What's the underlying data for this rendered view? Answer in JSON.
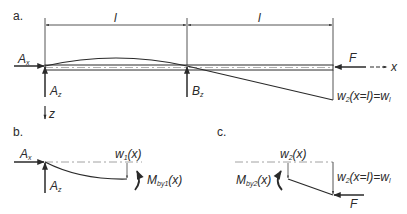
{
  "figure": {
    "panels": [
      {
        "id": "a",
        "label": "a.",
        "span_labels": [
          "l",
          "l"
        ],
        "support_left": {
          "horizontal": "A",
          "horizontal_sub": "x",
          "vertical": "A",
          "vertical_sub": "z"
        },
        "support_middle": {
          "vertical": "B",
          "vertical_sub": "z"
        },
        "force": "F",
        "axis_x": "x",
        "axis_z": "z",
        "tip_deflection": {
          "main": "w",
          "sub": "2",
          "rest": "(x=l)=w",
          "rest_sub": "l"
        }
      },
      {
        "id": "b",
        "label": "b.",
        "support_left": {
          "horizontal": "A",
          "horizontal_sub": "x",
          "vertical": "A",
          "vertical_sub": "z"
        },
        "deflection": {
          "main": "w",
          "sub": "1",
          "rest": "(x)"
        },
        "moment": {
          "main": "M",
          "sub": "by1",
          "rest": "(x)"
        }
      },
      {
        "id": "c",
        "label": "c.",
        "deflection": {
          "main": "w",
          "sub": "2",
          "rest": "(x)"
        },
        "tip_deflection": {
          "main": "w",
          "sub": "2",
          "rest": "(x=l)=w",
          "rest_sub": "l"
        },
        "moment": {
          "main": "M",
          "sub": "by2",
          "rest": "(x)"
        },
        "force": "F"
      }
    ]
  }
}
